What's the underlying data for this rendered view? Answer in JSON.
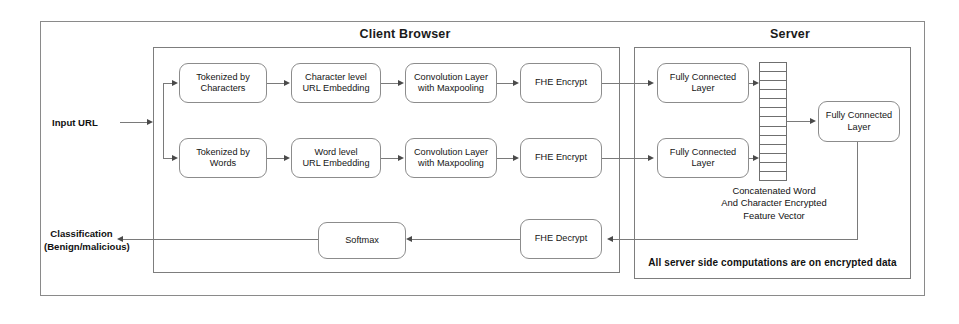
{
  "diagram": {
    "outer_frame": {
      "name": "outer-frame"
    },
    "regions": [
      {
        "id": "client",
        "title": "Client Browser"
      },
      {
        "id": "server",
        "title": "Server"
      }
    ],
    "inputs": {
      "input_url_label": "Input URL"
    },
    "outputs": {
      "classification_label": "Classification\n(Benign/malicious)"
    },
    "client_nodes": {
      "tokenized_characters": "Tokenized by\nCharacters",
      "tokenized_words": "Tokenized by\nWords",
      "char_embedding": "Character level\nURL Embedding",
      "word_embedding": "Word level\nURL Embedding",
      "conv_char": "Convolution Layer\nwith Maxpooling",
      "conv_word": "Convolution Layer\nwith Maxpooling",
      "fhe_encrypt_char": "FHE Encrypt",
      "fhe_encrypt_word": "FHE Encrypt",
      "fhe_decrypt": "FHE Decrypt",
      "softmax": "Softmax"
    },
    "server_nodes": {
      "fc_char": "Fully Connected\nLayer",
      "fc_word": "Fully Connected\nLayer",
      "fc_final": "Fully Connected\nLayer",
      "feature_vector_caption": "Concatenated Word\nAnd Character Encrypted\nFeature Vector",
      "feature_vector_cells": 13,
      "server_note": "All server side computations are on encrypted data"
    },
    "colors": {
      "frame_stroke": "#8a8a8a",
      "node_stroke": "#8c8c8c",
      "connector_stroke": "#7a7a7a",
      "arrow_fill": "#4a4a4a",
      "text": "#151515",
      "background": "#ffffff"
    }
  }
}
